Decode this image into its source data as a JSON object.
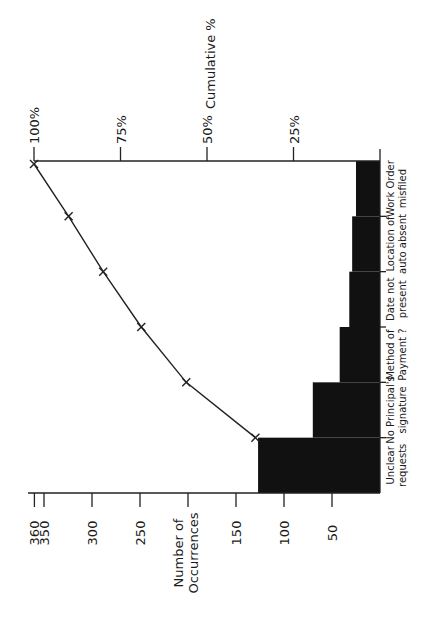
{
  "chart_data": {
    "type": "bar",
    "subtype": "pareto",
    "orientation": "rotated-90-ccw",
    "title": "",
    "categories": [
      "Unclear requests",
      "No Principal's signature",
      "Method of Payment ?",
      "Date not present",
      "Location of auto absent",
      "Work Order misfiled"
    ],
    "category_lines": [
      [
        "Unclear",
        "requests"
      ],
      [
        "No Principal's",
        "signature"
      ],
      [
        "Method of",
        "Payment ?"
      ],
      [
        "Date not",
        "present"
      ],
      [
        "Location of",
        "auto absent"
      ],
      [
        "Work Order",
        "misfiled"
      ]
    ],
    "series": [
      {
        "name": "Number of Occurrences",
        "type": "bar",
        "values": [
          127,
          70,
          42,
          32,
          29,
          25
        ]
      },
      {
        "name": "Cumulative %",
        "type": "line",
        "values": [
          36,
          56,
          69,
          80,
          90,
          100
        ]
      }
    ],
    "ylabel": "Number of Occurrences",
    "y2label": "Cumulative %",
    "ylim": [
      0,
      360
    ],
    "y_ticks": [
      50,
      100,
      150,
      200,
      250,
      300,
      350,
      360
    ],
    "y_tick_labels": [
      "50",
      "100",
      "150",
      "",
      "250",
      "300",
      "350",
      "360"
    ],
    "y2lim": [
      0,
      100
    ],
    "y2_ticks": [
      25,
      50,
      75,
      100
    ],
    "y2_tick_labels": [
      "25%",
      "50%",
      "75%",
      "100%"
    ],
    "grid": false,
    "legend": "none"
  }
}
